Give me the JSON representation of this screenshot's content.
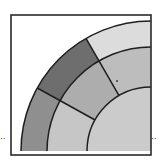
{
  "diagram": {
    "type": "quarter-circle-ring-diagram",
    "frame": {
      "x": 11,
      "y": 15,
      "size": 140,
      "stroke": "#2a2a2a"
    },
    "center": {
      "x": 151,
      "y": 151
    },
    "radii": {
      "inner": 64,
      "middle": 104,
      "outer": 130
    },
    "divider_angles_deg": [
      120,
      151
    ],
    "regions": {
      "outer_right": {
        "color": "#dcdcdc",
        "ring": "outer",
        "from_deg": 90,
        "to_deg": 120
      },
      "outer_mid": {
        "color": "#6e6e6e",
        "ring": "outer",
        "from_deg": 120,
        "to_deg": 151
      },
      "outer_left": {
        "color": "#8f8f8f",
        "ring": "outer",
        "from_deg": 151,
        "to_deg": 180
      },
      "middle_right": {
        "color": "#bdbdbd",
        "ring": "middle",
        "from_deg": 90,
        "to_deg": 120
      },
      "middle_mid": {
        "color": "#adadad",
        "ring": "middle",
        "from_deg": 120,
        "to_deg": 151
      },
      "middle_left": {
        "color": "#c6c6c6",
        "ring": "middle",
        "from_deg": 151,
        "to_deg": 180
      },
      "inner": {
        "color": "#cbcbcb",
        "ring": "inner",
        "from_deg": 90,
        "to_deg": 180
      }
    },
    "line_color": "#1e1e1e",
    "marks": {
      "left_dots": "··",
      "right_dots": "··"
    }
  }
}
